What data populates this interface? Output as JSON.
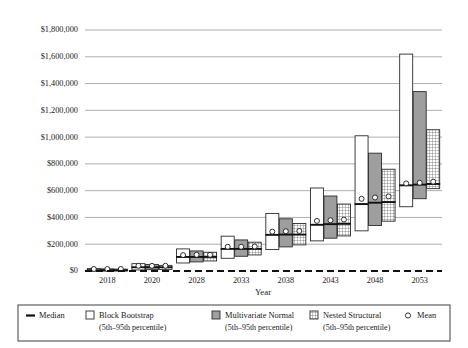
{
  "chart_data": {
    "type": "bar",
    "title": "",
    "xlabel": "Year",
    "ylabel": "",
    "categories": [
      "2018",
      "2020",
      "2028",
      "2033",
      "2038",
      "2043",
      "2048",
      "2053"
    ],
    "ylim": [
      0,
      1800000
    ],
    "ytick_values": [
      0,
      200000,
      400000,
      600000,
      800000,
      1000000,
      1200000,
      1400000,
      1600000,
      1800000
    ],
    "ytick_labels": [
      "$0",
      "$200,000",
      "$400,000",
      "$600,000",
      "$800,000",
      "$1,000,000",
      "$1,200,000",
      "$1,400,000",
      "$1,600,000",
      "$1,800,000"
    ],
    "grid": true,
    "legend_position": "bottom",
    "series": [
      {
        "name": "Block Bootstrap",
        "sub": "(5th–95th percentile)",
        "style": "white",
        "low": [
          0,
          8000,
          60000,
          95000,
          160000,
          225000,
          300000,
          480000
        ],
        "high": [
          18000,
          55000,
          165000,
          260000,
          430000,
          620000,
          1010000,
          1620000
        ],
        "median": [
          6000,
          28000,
          105000,
          165000,
          270000,
          345000,
          500000,
          640000
        ],
        "mean": [
          6000,
          30000,
          110000,
          172000,
          285000,
          365000,
          530000,
          645000
        ]
      },
      {
        "name": "Multivariate Normal",
        "sub": "(5th–95th percentile)",
        "style": "gray",
        "low": [
          0,
          10000,
          68000,
          110000,
          180000,
          245000,
          340000,
          540000
        ],
        "high": [
          16000,
          48000,
          150000,
          232000,
          390000,
          560000,
          880000,
          1340000
        ],
        "median": [
          6000,
          28000,
          105000,
          165000,
          272000,
          350000,
          510000,
          645000
        ],
        "mean": [
          6000,
          30000,
          112000,
          172000,
          288000,
          370000,
          540000,
          650000
        ]
      },
      {
        "name": "Nested Structural",
        "sub": "(5th–95th percentile)",
        "style": "hatch",
        "low": [
          0,
          12000,
          75000,
          120000,
          195000,
          262000,
          372000,
          615000
        ],
        "high": [
          14000,
          42000,
          140000,
          215000,
          355000,
          500000,
          760000,
          1055000
        ],
        "median": [
          6000,
          28000,
          105000,
          165000,
          272000,
          352000,
          515000,
          650000
        ],
        "mean": [
          6000,
          30000,
          112000,
          174000,
          290000,
          375000,
          548000,
          658000
        ]
      }
    ],
    "marker_series": [
      {
        "name": "Median",
        "style": "line"
      },
      {
        "name": "Mean",
        "style": "circle"
      }
    ]
  },
  "legend": {
    "items": [
      {
        "label": "Median",
        "sub": "",
        "swatch": "median-line-swatch"
      },
      {
        "label": "Block Bootstrap",
        "sub": "(5th–95th percentile)",
        "swatch": "white-square-swatch"
      },
      {
        "label": "Multivariate Normal",
        "sub": "(5th–95th percentile)",
        "swatch": "gray-square-swatch"
      },
      {
        "label": "Nested Structural",
        "sub": "(5th–95th percentile)",
        "swatch": "hatch-square-swatch"
      },
      {
        "label": "Mean",
        "sub": "",
        "swatch": "circle-swatch"
      }
    ]
  },
  "colors": {
    "grid": "#9a9a9a",
    "outline": "#2b2b2b",
    "gray_fill": "#9e9e9e",
    "white_fill": "#ffffff",
    "text": "#1a1a1a"
  }
}
